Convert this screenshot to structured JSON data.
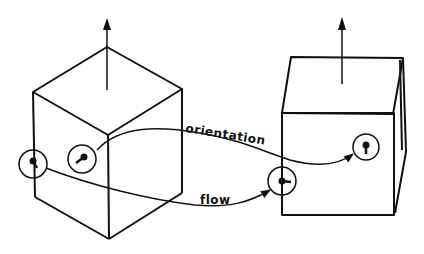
{
  "diagram": {
    "labels": {
      "orientation": "orientation",
      "flow": "flow"
    },
    "colors": {
      "stroke": "#111111",
      "background": "#ffffff"
    },
    "elements": {
      "left_cube": "isometric cube with upward normal arrow",
      "right_cube": "cube in perspective with upward normal arrow",
      "markers": [
        "circle-marker-left-edge",
        "circle-marker-left-face",
        "circle-marker-right-edge",
        "circle-marker-right-face"
      ],
      "curves": [
        "orientation-curve",
        "flow-curve"
      ]
    }
  }
}
